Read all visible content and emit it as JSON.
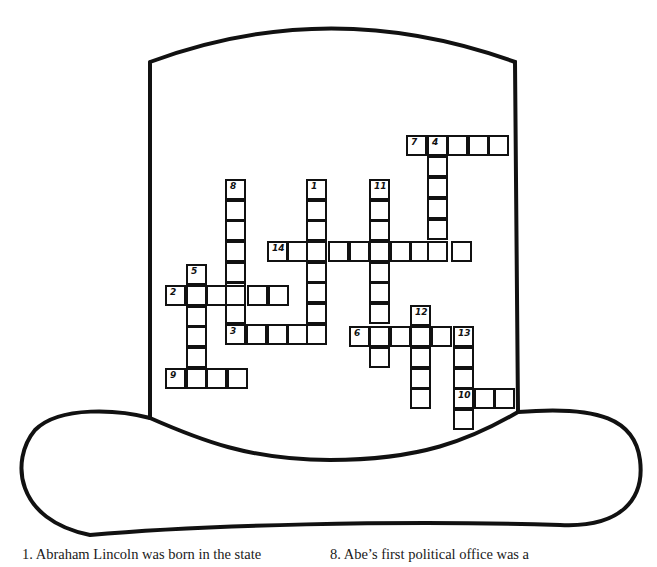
{
  "colors": {
    "ink": "#111111",
    "background": "#ffffff"
  },
  "grid": {
    "cell_size": 20.5,
    "cells": [
      {
        "x": 406,
        "y": 135,
        "num": "7"
      },
      {
        "x": 427,
        "y": 135,
        "num": "4"
      },
      {
        "x": 447,
        "y": 135
      },
      {
        "x": 468,
        "y": 135
      },
      {
        "x": 488,
        "y": 135
      },
      {
        "x": 427,
        "y": 156
      },
      {
        "x": 427,
        "y": 177
      },
      {
        "x": 427,
        "y": 198
      },
      {
        "x": 427,
        "y": 219
      },
      {
        "x": 225,
        "y": 179,
        "num": "8"
      },
      {
        "x": 225,
        "y": 200
      },
      {
        "x": 225,
        "y": 220
      },
      {
        "x": 225,
        "y": 241
      },
      {
        "x": 225,
        "y": 262
      },
      {
        "x": 225,
        "y": 282
      },
      {
        "x": 225,
        "y": 303
      },
      {
        "x": 306,
        "y": 179,
        "num": "1"
      },
      {
        "x": 306,
        "y": 200
      },
      {
        "x": 306,
        "y": 220
      },
      {
        "x": 306,
        "y": 262
      },
      {
        "x": 306,
        "y": 282
      },
      {
        "x": 306,
        "y": 303
      },
      {
        "x": 369,
        "y": 179,
        "num": "11"
      },
      {
        "x": 369,
        "y": 200
      },
      {
        "x": 369,
        "y": 220
      },
      {
        "x": 369,
        "y": 262
      },
      {
        "x": 369,
        "y": 282
      },
      {
        "x": 369,
        "y": 303
      },
      {
        "x": 369,
        "y": 347
      },
      {
        "x": 267,
        "y": 241,
        "num": "14"
      },
      {
        "x": 287,
        "y": 241
      },
      {
        "x": 306,
        "y": 241
      },
      {
        "x": 328,
        "y": 241
      },
      {
        "x": 349,
        "y": 241
      },
      {
        "x": 369,
        "y": 241
      },
      {
        "x": 390,
        "y": 241
      },
      {
        "x": 410,
        "y": 241
      },
      {
        "x": 427,
        "y": 241
      },
      {
        "x": 451,
        "y": 241
      },
      {
        "x": 186,
        "y": 264,
        "num": "5"
      },
      {
        "x": 165,
        "y": 285,
        "num": "2"
      },
      {
        "x": 186,
        "y": 285
      },
      {
        "x": 206,
        "y": 285
      },
      {
        "x": 225,
        "y": 285
      },
      {
        "x": 247,
        "y": 285
      },
      {
        "x": 268,
        "y": 285
      },
      {
        "x": 186,
        "y": 306
      },
      {
        "x": 186,
        "y": 326
      },
      {
        "x": 186,
        "y": 347
      },
      {
        "x": 225,
        "y": 324,
        "num": "3"
      },
      {
        "x": 246,
        "y": 324
      },
      {
        "x": 267,
        "y": 324
      },
      {
        "x": 287,
        "y": 324
      },
      {
        "x": 306,
        "y": 324
      },
      {
        "x": 410,
        "y": 305,
        "num": "12"
      },
      {
        "x": 349,
        "y": 326,
        "num": "6"
      },
      {
        "x": 369,
        "y": 326
      },
      {
        "x": 390,
        "y": 326
      },
      {
        "x": 410,
        "y": 326
      },
      {
        "x": 431,
        "y": 326
      },
      {
        "x": 453,
        "y": 326,
        "num": "13"
      },
      {
        "x": 410,
        "y": 347
      },
      {
        "x": 410,
        "y": 368
      },
      {
        "x": 410,
        "y": 388
      },
      {
        "x": 453,
        "y": 347
      },
      {
        "x": 453,
        "y": 368
      },
      {
        "x": 453,
        "y": 388,
        "num": "10"
      },
      {
        "x": 474,
        "y": 388
      },
      {
        "x": 494,
        "y": 388
      },
      {
        "x": 453,
        "y": 409
      },
      {
        "x": 165,
        "y": 368,
        "num": "9"
      },
      {
        "x": 186,
        "y": 368
      },
      {
        "x": 206,
        "y": 368
      },
      {
        "x": 227,
        "y": 368
      }
    ]
  },
  "clues": {
    "c1": "1.  Abraham Lincoln was born in the state",
    "c8": "8.  Abe’s first political office was a"
  }
}
